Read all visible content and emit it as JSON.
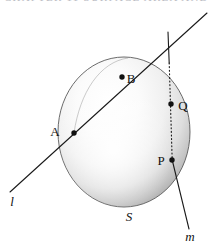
{
  "figure": {
    "caption_strip": "CHAPTER 11  SURFACE AREA AND VOLUME",
    "type": "geometry-diagram",
    "colors": {
      "stroke": "#1a1a1a",
      "sphere_light": "#ffffff",
      "sphere_mid": "#dcdcdc",
      "sphere_shadow": "#a8a8a8",
      "outline": "#555555",
      "background": "#ffffff"
    },
    "sphere": {
      "label": "S",
      "center_x": 124,
      "center_y": 132,
      "radius_x": 66,
      "radius_y": 75
    },
    "points": [
      {
        "id": "A",
        "label": "A",
        "x": 74,
        "y": 133,
        "label_x": 58,
        "label_y": 130
      },
      {
        "id": "B",
        "label": "B",
        "x": 122,
        "y": 77,
        "label_x": 127,
        "label_y": 79
      },
      {
        "id": "Q",
        "label": "Q",
        "x": 171,
        "y": 104,
        "label_x": 177,
        "label_y": 108
      },
      {
        "id": "P",
        "label": "P",
        "x": 172,
        "y": 160,
        "label_x": 157,
        "label_y": 164
      }
    ],
    "lines": [
      {
        "id": "l",
        "label": "l",
        "style": "solid",
        "description": "secant line through A and B",
        "x1": 10,
        "y1": 192,
        "x2": 207,
        "y2": 13,
        "label_x": 11,
        "label_y": 205
      },
      {
        "id": "m",
        "label": "m",
        "style": "dotted-inside-sphere",
        "description": "line through Q and P, dotted where hidden inside the sphere",
        "x1": 168,
        "y1": 32,
        "x2": 189,
        "y2": 229,
        "label_x": 185,
        "label_y": 241
      }
    ]
  }
}
